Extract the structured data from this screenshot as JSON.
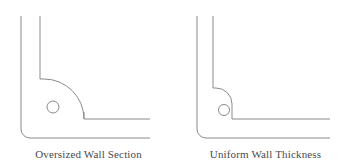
{
  "document": {
    "title": "Wall Section Comparison",
    "background_color": "#ffffff",
    "line_color": "#8a8a8f",
    "caption_color": "#4a4a4f"
  },
  "figures": [
    {
      "id": "oversized",
      "caption": "Oversized Wall Section",
      "description": "L-shaped corner cross-section with a large inner corner radius producing a thick, oversized material section at the corner",
      "geometry": {
        "outer_vertical_x": 21,
        "inner_vertical_x": 40,
        "vertical_top_y": 16,
        "outer_horizontal_y": 138,
        "inner_horizontal_y": 119,
        "horizontal_right_x": 150,
        "outer_corner_radius": 9,
        "inner_corner_radius": 40,
        "wall_thickness": 19
      },
      "marker_circle": {
        "label": "thick-section-indicator",
        "cx": 53,
        "cy": 107,
        "r": 6
      }
    },
    {
      "id": "uniform",
      "caption": "Uniform Wall Thickness",
      "description": "L-shaped corner cross-section with matched inner and outer radii maintaining a constant wall thickness around the corner",
      "geometry": {
        "outer_vertical_x": 197,
        "inner_vertical_x": 213,
        "vertical_top_y": 16,
        "outer_horizontal_y": 138,
        "inner_horizontal_y": 119,
        "horizontal_right_x": 330,
        "outer_corner_radius": 9,
        "inner_corner_radius": 16,
        "wall_thickness": 16
      },
      "marker_circle": {
        "label": "uniform-section-indicator",
        "cx": 224,
        "cy": 110,
        "r": 5.5
      }
    }
  ]
}
